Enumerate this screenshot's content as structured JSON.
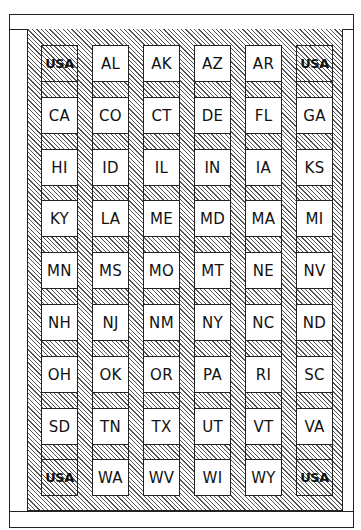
{
  "diagram": {
    "type": "grid-layout",
    "rows": 9,
    "columns": 6,
    "corner_label": "USA",
    "hatch_color": "#555555",
    "line_color": "#222222",
    "background_color": "#ffffff",
    "cells": [
      [
        "USA",
        "AL",
        "AK",
        "AZ",
        "AR",
        "USA"
      ],
      [
        "CA",
        "CO",
        "CT",
        "DE",
        "FL",
        "GA"
      ],
      [
        "HI",
        "ID",
        "IL",
        "IN",
        "IA",
        "KS"
      ],
      [
        "KY",
        "LA",
        "ME",
        "MD",
        "MA",
        "MI"
      ],
      [
        "MN",
        "MS",
        "MO",
        "MT",
        "NE",
        "NV"
      ],
      [
        "NH",
        "NJ",
        "NM",
        "NY",
        "NC",
        "ND"
      ],
      [
        "OH",
        "OK",
        "OR",
        "PA",
        "RI",
        "SC"
      ],
      [
        "SD",
        "TN",
        "TX",
        "UT",
        "VT",
        "VA"
      ],
      [
        "USA",
        "WA",
        "WV",
        "WI",
        "WY",
        "USA"
      ]
    ]
  }
}
